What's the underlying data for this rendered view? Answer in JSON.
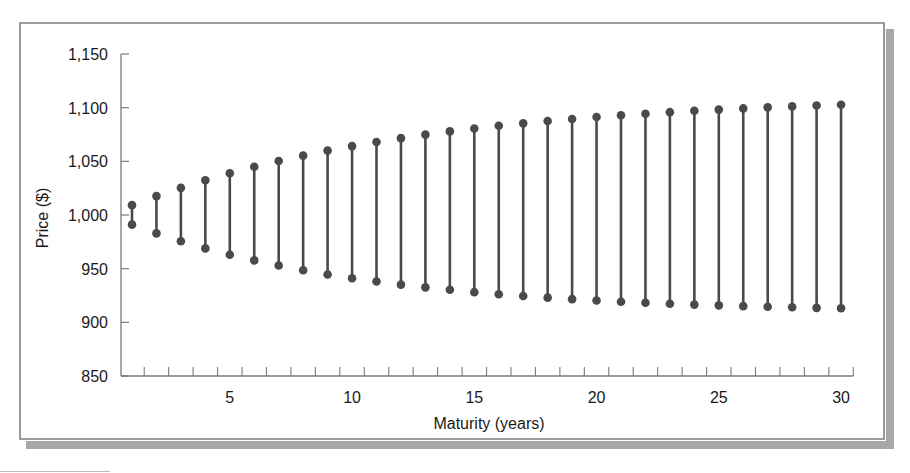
{
  "chart_data": {
    "type": "range-dot (dumbbell)",
    "title": "",
    "xlabel": "Maturity (years)",
    "ylabel": "Price ($)",
    "xlim": [
      0.5,
      30.5
    ],
    "ylim": [
      850,
      1150
    ],
    "x_ticks": [
      5,
      10,
      15,
      20,
      25,
      30
    ],
    "y_ticks": [
      850,
      900,
      950,
      1000,
      1050,
      1100,
      1150
    ],
    "y_tick_labels": [
      "850",
      "900",
      "950",
      "1,000",
      "1,050",
      "1,100",
      "1,150"
    ],
    "grid": false,
    "legend": null,
    "x": [
      1,
      2,
      3,
      4,
      5,
      6,
      7,
      8,
      9,
      10,
      11,
      12,
      13,
      14,
      15,
      16,
      17,
      18,
      19,
      20,
      21,
      22,
      23,
      24,
      25,
      26,
      27,
      28,
      29,
      30
    ],
    "series": [
      {
        "name": "Upper price",
        "values": [
          1009.2,
          1017.6,
          1025.3,
          1032.4,
          1038.9,
          1044.9,
          1050.3,
          1055.3,
          1060.0,
          1064.2,
          1068.0,
          1071.6,
          1074.9,
          1077.9,
          1080.6,
          1083.1,
          1085.4,
          1087.6,
          1089.5,
          1091.3,
          1092.9,
          1094.4,
          1095.8,
          1097.1,
          1098.2,
          1099.3,
          1100.3,
          1101.2,
          1102.0,
          1102.7
        ]
      },
      {
        "name": "Lower price",
        "values": [
          991.0,
          982.9,
          975.6,
          968.9,
          963.0,
          957.7,
          952.9,
          948.5,
          944.6,
          941.1,
          938.0,
          935.1,
          932.6,
          930.3,
          928.1,
          926.2,
          924.5,
          923.0,
          921.6,
          920.4,
          919.2,
          918.2,
          917.3,
          916.5,
          915.8,
          915.1,
          914.5,
          914.0,
          913.5,
          913.1
        ]
      }
    ],
    "colors": {
      "markers": "#4a4a4a",
      "axes": "#7a7a7a",
      "frame": "#9a9a9a",
      "shadow": "#a8a8a8"
    }
  },
  "labels": {
    "xlabel": "Maturity (years)",
    "ylabel": "Price ($)"
  }
}
